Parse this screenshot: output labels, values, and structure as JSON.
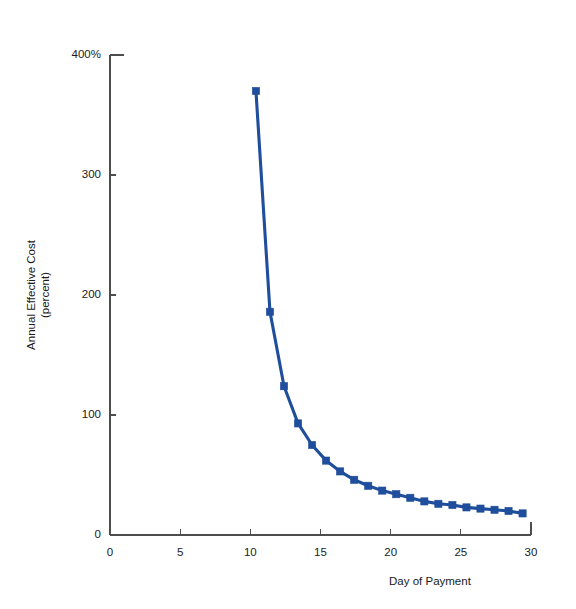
{
  "chart_data": {
    "type": "line",
    "title": "",
    "subtitle": "",
    "xlabel": "Day of Payment",
    "ylabel": "Annual Effective Cost",
    "ylabel_line2": "(percent)",
    "xlim": [
      0,
      30
    ],
    "ylim": [
      0,
      400
    ],
    "xticks": [
      0,
      5,
      10,
      15,
      20,
      25,
      30
    ],
    "xtick_labels": [
      "0",
      "5",
      "10",
      "15",
      "20",
      "25",
      "30"
    ],
    "yticks": [
      0,
      100,
      200,
      300,
      400
    ],
    "ytick_labels": [
      "0",
      "100",
      "200",
      "300",
      "400%"
    ],
    "grid": false,
    "legend": "none",
    "series": [
      {
        "name": "Annual Effective Cost",
        "color": "#1F4E9C",
        "marker": "square",
        "x": [
          10.4,
          11.4,
          12.4,
          13.4,
          14.4,
          15.4,
          16.4,
          17.4,
          18.4,
          19.4,
          20.4,
          21.4,
          22.4,
          23.4,
          24.4,
          25.4,
          26.4,
          27.4,
          28.4,
          29.4
        ],
        "y": [
          370,
          186,
          124,
          93,
          75,
          62,
          53,
          46,
          41,
          37,
          34,
          31,
          28,
          26,
          25,
          23,
          22,
          21,
          20,
          18
        ]
      }
    ]
  },
  "axes_geometry": {
    "left_px": 110,
    "right_px": 531,
    "top_px": 55,
    "bottom_px": 535
  },
  "colors": {
    "series": "#1F4E9C",
    "axis": "#4d4d4d",
    "text": "#1a1a1a",
    "background": "#ffffff"
  }
}
